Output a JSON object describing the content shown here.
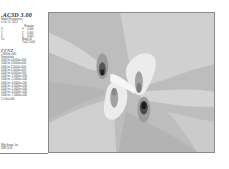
{
  "legend": {
    "title": ".AC3D 3.00",
    "subtitle": "Model Perspective",
    "date": "e Oct 11, 2012",
    "rotation_header": "Rotation",
    "view_rows": [
      {
        "label": "X",
        "axis": "X",
        "value": "0.000"
      },
      {
        "label": "Y",
        "axis": "Y",
        "value": "0.000"
      },
      {
        "label": "Z",
        "axis": "Z",
        "value": "0.000"
      },
      {
        "label": "Ctr",
        "axis": "Mag",
        "value": "0.01"
      },
      {
        "label": "",
        "axis": "Trig",
        "value": "12.000"
      }
    ],
    "section_title": "FFNZ",
    "section_value": "2.8050e+000",
    "section_label": "Stimulation",
    "value_rows": [
      "1000 hz  4.0000e+000",
      "1000 hz  3.0000e+000",
      "1000 hz  2.0000e+000",
      "1000 hz  1.0000e+000",
      "1000 hz  0.0000e+000",
      "1000 hz -1.0000e+000",
      "1000 hz -2.0000e+000",
      "1000 hz -3.0000e+000",
      "1000 hz -4.0000e+000",
      "1000 hz -5.0000e+000",
      "1000 hz -6.0000e+000",
      "1000 hz -7.0000e+000",
      "1.2 thin 000"
    ],
    "footer": [
      "Mfg Group, Inc.",
      "SWI  1104"
    ]
  },
  "plot": {
    "description": "Grayscale contour field plot with dipole-like lobes",
    "colors": {
      "background": "#bdbdbd",
      "light": "#d6d6d6",
      "lighter": "#e6e6e6",
      "white": "#f4f4f4",
      "mid": "#a8a8a8",
      "dark": "#777777",
      "darkest": "#1e1e1e",
      "border": "#8a8a8a"
    }
  }
}
